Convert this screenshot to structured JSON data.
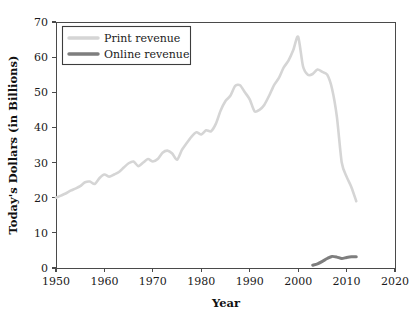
{
  "chart_data": {
    "type": "line",
    "title": "",
    "xlabel": "Year",
    "ylabel": "Today's Dollars (in Billions)",
    "xlim": [
      1950,
      2020
    ],
    "ylim": [
      0,
      70
    ],
    "xticks": [
      1950,
      1960,
      1970,
      1980,
      1990,
      2000,
      2010,
      2020
    ],
    "yticks": [
      0,
      10,
      20,
      30,
      40,
      50,
      60,
      70
    ],
    "grid": false,
    "legend_position": "upper left",
    "series": [
      {
        "name": "Print revenue",
        "color": "#d5d5d5",
        "x": [
          1950,
          1951,
          1952,
          1953,
          1954,
          1955,
          1956,
          1957,
          1958,
          1959,
          1960,
          1961,
          1962,
          1963,
          1964,
          1965,
          1966,
          1967,
          1968,
          1969,
          1970,
          1971,
          1972,
          1973,
          1974,
          1975,
          1976,
          1977,
          1978,
          1979,
          1980,
          1981,
          1982,
          1983,
          1984,
          1985,
          1986,
          1987,
          1988,
          1989,
          1990,
          1991,
          1992,
          1993,
          1994,
          1995,
          1996,
          1997,
          1998,
          1999,
          2000,
          2001,
          2002,
          2003,
          2004,
          2005,
          2006,
          2007,
          2008,
          2009,
          2010,
          2011,
          2012
        ],
        "values": [
          20.0,
          20.6,
          21.2,
          22.0,
          22.6,
          23.3,
          24.4,
          24.6,
          23.9,
          25.6,
          26.6,
          26.0,
          26.6,
          27.3,
          28.6,
          29.8,
          30.3,
          29.0,
          30.0,
          31.0,
          30.3,
          31.0,
          32.8,
          33.4,
          32.6,
          30.8,
          33.6,
          35.6,
          37.4,
          38.6,
          38.0,
          39.2,
          38.9,
          41.0,
          44.8,
          47.5,
          49.0,
          51.8,
          52.0,
          50.0,
          48.0,
          44.6,
          45.0,
          46.4,
          49.0,
          52.0,
          54.0,
          57.0,
          59.0,
          62.0,
          65.8,
          57.4,
          55.0,
          55.2,
          56.5,
          55.8,
          55.0,
          51.0,
          43.0,
          30.0,
          26.0,
          23.0,
          19.0
        ]
      },
      {
        "name": "Online revenue",
        "color": "#7e7e7e",
        "x": [
          2003,
          2004,
          2005,
          2006,
          2007,
          2008,
          2009,
          2010,
          2011,
          2012
        ],
        "values": [
          0.8,
          1.2,
          1.9,
          2.7,
          3.3,
          3.1,
          2.7,
          3.0,
          3.2,
          3.2
        ]
      }
    ]
  },
  "legend": {
    "items": [
      {
        "label": "Print revenue"
      },
      {
        "label": "Online revenue"
      }
    ]
  },
  "axes": {
    "x_title": "Year",
    "y_title": "Today's Dollars (in Billions)",
    "x_tick_labels": [
      "1950",
      "1960",
      "1970",
      "1980",
      "1990",
      "2000",
      "2010",
      "2020"
    ],
    "y_tick_labels": [
      "0",
      "10",
      "20",
      "30",
      "40",
      "50",
      "60",
      "70"
    ]
  },
  "colors": {
    "print_series": "#d5d5d5",
    "online_series": "#7e7e7e",
    "axis": "#4a4a4a",
    "text": "#1a1a1a",
    "background": "#ffffff"
  }
}
